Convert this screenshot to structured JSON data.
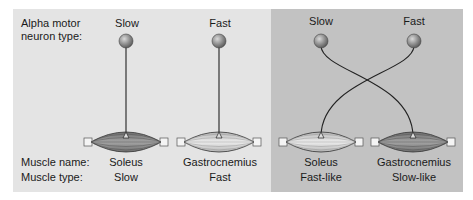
{
  "row_labels": {
    "neuron_type_line1": "Alpha motor",
    "neuron_type_line2": "neuron type:",
    "muscle_name": "Muscle name:",
    "muscle_type": "Muscle type:"
  },
  "panels": [
    {
      "name": "normal-innervation",
      "background": "#e4e4e4",
      "columns": [
        {
          "neuron": "Slow",
          "muscle_name": "Soleus",
          "muscle_type": "Slow"
        },
        {
          "neuron": "Fast",
          "muscle_name": "Gastrocnemius",
          "muscle_type": "Fast"
        }
      ]
    },
    {
      "name": "cross-innervation",
      "background": "#c2c2c2",
      "columns": [
        {
          "neuron": "Slow",
          "muscle_name": "Soleus",
          "muscle_type": "Fast-like"
        },
        {
          "neuron": "Fast",
          "muscle_name": "Gastrocnemius",
          "muscle_type": "Slow-like"
        }
      ]
    }
  ],
  "colors": {
    "slow_muscle_fill": "#8a8a8a",
    "fast_muscle_fill": "#d8d8d8",
    "neuron_ball": "#8f8f8f",
    "axon": "#222222"
  }
}
